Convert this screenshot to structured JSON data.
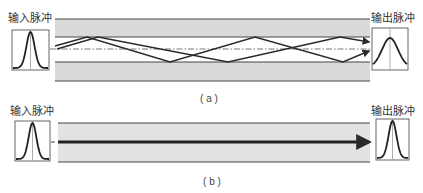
{
  "colors": {
    "cladding": "#dadada",
    "cladding_b": "#e2e2e2",
    "line": "#444444",
    "ray": "#2a2a2a"
  },
  "panel_a": {
    "input_label": "输入脉冲",
    "output_label": "输出脉冲",
    "caption": "( a )",
    "input_pulse": {
      "sigma": 0.11,
      "peak_offset": 2,
      "base_offset": 2
    },
    "output_pulse": {
      "sigma": 0.22,
      "peak_offset": 10,
      "base_offset": 3
    },
    "rays": [
      [
        [
          55,
          46
        ],
        [
          87,
          37
        ],
        [
          170,
          62
        ],
        [
          255,
          37
        ],
        [
          343,
          62
        ],
        [
          369,
          51
        ]
      ],
      [
        [
          57,
          49
        ],
        [
          98,
          37
        ],
        [
          228,
          62
        ],
        [
          340,
          37
        ],
        [
          369,
          42
        ]
      ]
    ]
  },
  "panel_b": {
    "input_label": "输入脉冲",
    "output_label": "输出脉冲",
    "caption": "( b )",
    "input_pulse": {
      "sigma": 0.11,
      "peak_offset": 2,
      "base_offset": 2
    },
    "output_pulse": {
      "sigma": 0.12,
      "peak_offset": 2,
      "base_offset": 2
    }
  }
}
